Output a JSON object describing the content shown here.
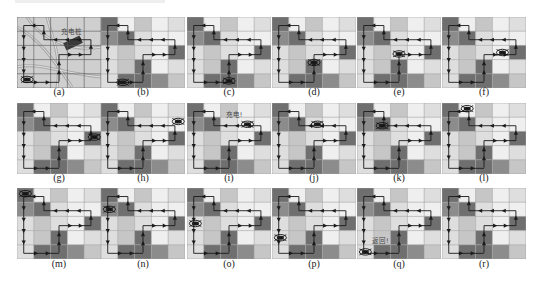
{
  "figure": {
    "grid": {
      "rows": 5,
      "cols": 5
    },
    "colors": {
      "dark": "#6f6f6f",
      "mid": "#8c8c8c",
      "midlight": "#c6c6c6",
      "light": "#dedede",
      "lighter": "#efefef",
      "gridline": "#a0a0a0",
      "path": "#1a1a1a",
      "map_bg": "#cfcfcf"
    },
    "cell_shades": [
      [
        "dark",
        "lighter",
        "midlight",
        "lighter",
        "light"
      ],
      [
        "mid",
        "dark",
        "light",
        "lighter",
        "lighter"
      ],
      [
        "light",
        "midlight",
        "light",
        "lighter",
        "dark"
      ],
      [
        "light",
        "midlight",
        "dark",
        "lighter",
        "light"
      ],
      [
        "light",
        "dark",
        "dark",
        "mid",
        "midlight"
      ]
    ],
    "path_points": [
      [
        2.5,
        4.55
      ],
      [
        2.5,
        2.65
      ],
      [
        4.4,
        2.65
      ],
      [
        4.4,
        1.6
      ],
      [
        1.6,
        1.6
      ],
      [
        1.6,
        0.6
      ],
      [
        0.4,
        0.6
      ],
      [
        0.4,
        4.6
      ],
      [
        2.5,
        4.6
      ]
    ],
    "panels": [
      {
        "id": "a",
        "caption": "(a)",
        "type": "map",
        "drone": [
          0.6,
          4.4
        ],
        "label": "充电桩",
        "label_pos": [
          2.6,
          1.2
        ]
      },
      {
        "id": "b",
        "caption": "(b)",
        "type": "grid",
        "drone": [
          1.3,
          4.6
        ]
      },
      {
        "id": "c",
        "caption": "(c)",
        "type": "grid",
        "drone": [
          2.5,
          4.5
        ]
      },
      {
        "id": "d",
        "caption": "(d)",
        "type": "grid",
        "drone": [
          2.5,
          3.2
        ]
      },
      {
        "id": "e",
        "caption": "(e)",
        "type": "grid",
        "drone": [
          2.5,
          2.6
        ]
      },
      {
        "id": "f",
        "caption": "(f)",
        "type": "grid",
        "drone": [
          3.6,
          2.5
        ]
      },
      {
        "id": "g",
        "caption": "(g)",
        "type": "grid",
        "drone": [
          4.6,
          2.4
        ]
      },
      {
        "id": "h",
        "caption": "(h)",
        "type": "grid",
        "drone": [
          4.6,
          1.3
        ]
      },
      {
        "id": "i",
        "caption": "(i)",
        "type": "grid",
        "drone": [
          3.6,
          1.5
        ],
        "label": "充电!",
        "label_pos": [
          2.3,
          1.0
        ]
      },
      {
        "id": "j",
        "caption": "(j)",
        "type": "grid",
        "drone": [
          2.7,
          1.5
        ]
      },
      {
        "id": "k",
        "caption": "(k)",
        "type": "grid",
        "drone": [
          1.5,
          1.6
        ]
      },
      {
        "id": "l",
        "caption": "(l)",
        "type": "grid",
        "drone": [
          1.5,
          0.4
        ]
      },
      {
        "id": "m",
        "caption": "(m)",
        "type": "grid",
        "drone": [
          0.5,
          0.4
        ]
      },
      {
        "id": "n",
        "caption": "(n)",
        "type": "grid",
        "drone": [
          0.5,
          1.5
        ]
      },
      {
        "id": "o",
        "caption": "(o)",
        "type": "grid",
        "drone": [
          0.5,
          2.5
        ]
      },
      {
        "id": "p",
        "caption": "(p)",
        "type": "grid",
        "drone": [
          0.5,
          3.5
        ]
      },
      {
        "id": "q",
        "caption": "(q)",
        "type": "grid",
        "drone": [
          0.5,
          4.5
        ],
        "label": "返回!",
        "label_pos": [
          0.9,
          3.9
        ]
      },
      {
        "id": "r",
        "caption": "(r)",
        "type": "grid",
        "drone": null
      }
    ],
    "layout": {
      "col_x": [
        17,
        101,
        187,
        272,
        357,
        442
      ],
      "row_y": [
        17,
        103,
        188
      ],
      "caption_y": [
        86,
        172,
        258
      ]
    }
  }
}
